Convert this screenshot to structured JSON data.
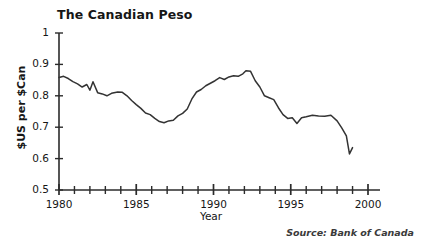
{
  "chart_data": {
    "type": "line",
    "title": "The Canadian Peso",
    "xlabel": "Year",
    "ylabel": "$US per $Can",
    "source": "Source: Bank of Canada",
    "grid": false,
    "legend": null,
    "xlim": [
      1980,
      2000
    ],
    "ylim": [
      0.5,
      1.0
    ],
    "xticks_major": [
      1980,
      1985,
      1990,
      1995,
      2000
    ],
    "xtick_labels": [
      "1980",
      "1985",
      "1990",
      "1995",
      "2000"
    ],
    "xticks_minor_step": 1,
    "yticks": [
      0.5,
      0.6,
      0.7,
      0.8,
      0.9,
      1.0
    ],
    "ytick_labels": [
      "0.5",
      "0.6",
      "0.7",
      "0.8",
      "0.9",
      "1"
    ],
    "line_color": "#333333",
    "series": [
      {
        "name": "$US per $Can",
        "x": [
          1980.0,
          1980.3,
          1980.6,
          1980.9,
          1981.2,
          1981.5,
          1981.8,
          1982.0,
          1982.2,
          1982.5,
          1982.8,
          1983.1,
          1983.4,
          1983.8,
          1984.1,
          1984.4,
          1984.7,
          1985.0,
          1985.3,
          1985.6,
          1985.9,
          1986.2,
          1986.5,
          1986.8,
          1987.1,
          1987.4,
          1987.7,
          1988.0,
          1988.3,
          1988.6,
          1988.9,
          1989.2,
          1989.5,
          1989.8,
          1990.1,
          1990.4,
          1990.7,
          1991.0,
          1991.3,
          1991.6,
          1991.9,
          1992.1,
          1992.4,
          1992.7,
          1993.0,
          1993.3,
          1993.6,
          1993.9,
          1994.2,
          1994.5,
          1994.8,
          1995.1,
          1995.4,
          1995.7,
          1996.0,
          1996.4,
          1996.8,
          1997.2,
          1997.6,
          1998.0,
          1998.3,
          1998.6,
          1998.8,
          1999.0
        ],
        "y": [
          0.858,
          0.862,
          0.855,
          0.845,
          0.838,
          0.828,
          0.836,
          0.818,
          0.845,
          0.81,
          0.806,
          0.8,
          0.808,
          0.812,
          0.811,
          0.8,
          0.785,
          0.772,
          0.76,
          0.745,
          0.74,
          0.728,
          0.718,
          0.714,
          0.72,
          0.722,
          0.736,
          0.744,
          0.758,
          0.79,
          0.812,
          0.82,
          0.832,
          0.84,
          0.848,
          0.858,
          0.852,
          0.86,
          0.864,
          0.862,
          0.87,
          0.88,
          0.878,
          0.848,
          0.828,
          0.8,
          0.794,
          0.788,
          0.762,
          0.74,
          0.728,
          0.73,
          0.712,
          0.73,
          0.733,
          0.738,
          0.736,
          0.735,
          0.738,
          0.72,
          0.698,
          0.672,
          0.615,
          0.635
        ]
      }
    ]
  }
}
